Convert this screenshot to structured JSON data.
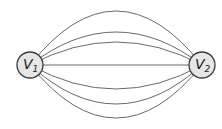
{
  "diagram": {
    "type": "multigraph",
    "nodes": [
      {
        "id": "v1",
        "label": "V",
        "subscript": "1",
        "cx": 30,
        "cy": 65,
        "r": 13
      },
      {
        "id": "v2",
        "label": "V",
        "subscript": "2",
        "cx": 202,
        "cy": 65,
        "r": 13
      }
    ],
    "edges": [
      {
        "from": "v1",
        "to": "v2",
        "mid_y": 11
      },
      {
        "from": "v1",
        "to": "v2",
        "mid_y": 32
      },
      {
        "from": "v1",
        "to": "v2",
        "mid_y": 42
      },
      {
        "from": "v1",
        "to": "v2",
        "mid_y": 65
      },
      {
        "from": "v1",
        "to": "v2",
        "mid_y": 89
      },
      {
        "from": "v1",
        "to": "v2",
        "mid_y": 104
      },
      {
        "from": "v1",
        "to": "v2",
        "mid_y": 118
      }
    ],
    "edge_count": 7,
    "colors": {
      "edge": "#6a6a6a",
      "node_fill": "#e6e6e6",
      "node_stroke": "#3a3a3a"
    }
  }
}
